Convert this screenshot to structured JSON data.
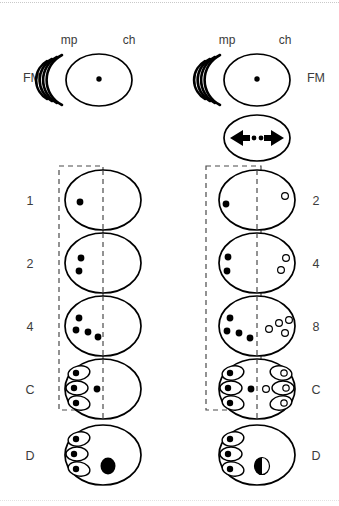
{
  "figure": {
    "background_color": "#ffffff",
    "line_color": "#000000",
    "dashed_color": "#4a4a4a"
  },
  "axis_labels": {
    "left_column": {
      "mp": "mp",
      "ch": "ch",
      "fm": "FM"
    },
    "right_column": {
      "mp": "mp",
      "ch": "ch",
      "fm": "FM"
    }
  },
  "left_column": {
    "stage_labels": [
      "1",
      "2",
      "4",
      "C",
      "D"
    ],
    "rows": [
      {
        "label": "1",
        "filled_nuclei": 1,
        "open_nuclei": 0,
        "pockets": 0,
        "big_nucleus": false
      },
      {
        "label": "2",
        "filled_nuclei": 2,
        "open_nuclei": 0,
        "pockets": 0,
        "big_nucleus": false
      },
      {
        "label": "4",
        "filled_nuclei": 4,
        "open_nuclei": 0,
        "pockets": 0,
        "big_nucleus": false
      },
      {
        "label": "C",
        "filled_nuclei": 1,
        "open_nuclei": 0,
        "pockets": 3,
        "big_nucleus": false
      },
      {
        "label": "D",
        "filled_nuclei": 0,
        "open_nuclei": 0,
        "pockets": 3,
        "big_nucleus": true
      }
    ]
  },
  "right_column": {
    "stage_labels": [
      "2",
      "4",
      "8",
      "C",
      "D"
    ],
    "rows": [
      {
        "label": "2",
        "filled_nuclei": 1,
        "open_nuclei": 1,
        "pockets": 0,
        "open_pockets": 0,
        "big_nucleus": false
      },
      {
        "label": "4",
        "filled_nuclei": 2,
        "open_nuclei": 2,
        "pockets": 0,
        "open_pockets": 0,
        "big_nucleus": false
      },
      {
        "label": "8",
        "filled_nuclei": 4,
        "open_nuclei": 4,
        "pockets": 0,
        "open_pockets": 0,
        "big_nucleus": false
      },
      {
        "label": "C",
        "filled_nuclei": 1,
        "open_nuclei": 1,
        "pockets": 3,
        "open_pockets": 3,
        "big_nucleus": false
      },
      {
        "label": "D",
        "filled_nuclei": 0,
        "open_nuclei": 0,
        "pockets": 3,
        "open_pockets": 0,
        "big_nucleus": true,
        "big_nucleus_half": true
      }
    ]
  },
  "top_cells": {
    "left_zygote": {
      "nucleus": "single-central-dot",
      "fm_arcs": 4
    },
    "right_zygote": {
      "nucleus": "single-central-dot",
      "fm_arcs": 4
    },
    "right_division_cell": {
      "symbol": "double-arrow-with-two-dots"
    }
  },
  "legend_semantics": {
    "filled_circle": "maternal / mp-side nucleus",
    "open_circle": "ch-side nucleus",
    "pocket": "polar-body-like compartment",
    "half_filled_circle": "partially differentiated nucleus"
  }
}
